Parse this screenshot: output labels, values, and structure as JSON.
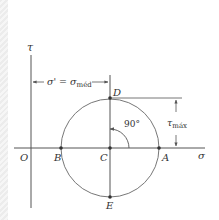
{
  "diagram": {
    "type": "mohr-circle",
    "axes": {
      "vertical_label": "τ",
      "horizontal_label": "σ",
      "origin_label": "O"
    },
    "points": {
      "B": "B",
      "C": "C",
      "A": "A",
      "D": "D",
      "E": "E"
    },
    "dimensions": {
      "sigma_prime": "σ' = σ",
      "sigma_prime_sub": "méd",
      "tau_max": "τ",
      "tau_max_sub": "máx",
      "angle": "90°"
    },
    "colors": {
      "line": "#555555",
      "circle": "#777777",
      "text": "#333333"
    }
  }
}
